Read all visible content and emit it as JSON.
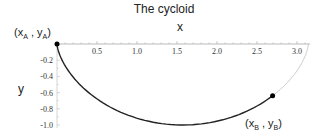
{
  "chart_data": {
    "type": "line",
    "title": "The cycloid",
    "xlabel": "x",
    "ylabel": "y",
    "x_ticks": [
      "0.5",
      "1.0",
      "1.5",
      "2.0",
      "2.5",
      "3.0"
    ],
    "y_ticks": [
      "-0.2",
      "-0.4",
      "-0.6",
      "-0.8",
      "-1.0"
    ],
    "xlim": [
      0,
      3.14159
    ],
    "ylim": [
      -1.0,
      0
    ],
    "grid": false,
    "series": [
      {
        "name": "cycloid path A to B",
        "style": "solid dark",
        "x": [
          0,
          0.04,
          0.16,
          0.36,
          0.6,
          0.93,
          1.28,
          1.57,
          1.86,
          2.21,
          2.31
        ],
        "y": [
          0,
          -0.2,
          -0.36,
          -0.52,
          -0.7,
          -0.85,
          -0.96,
          -1.0,
          -0.96,
          -0.85,
          -0.8
        ]
      },
      {
        "name": "cycloid continuation",
        "style": "light gray",
        "x": [
          2.31,
          2.54,
          2.78,
          2.98,
          3.1,
          3.14
        ],
        "y": [
          -0.8,
          -0.6,
          -0.38,
          -0.17,
          -0.04,
          0
        ]
      }
    ],
    "annotations": [
      {
        "label": "(x_A , y_A)",
        "x": 0,
        "y": 0
      },
      {
        "label": "(x_B , y_B)",
        "x": 2.31,
        "y": -0.8
      }
    ]
  },
  "labels": {
    "title": "The cycloid",
    "x": "x",
    "y": "y",
    "pointA": {
      "open": "(x",
      "sub1": "A",
      "mid": " , y",
      "sub2": "A",
      "close": ")"
    },
    "pointB": {
      "open": "(x",
      "sub1": "B",
      "mid": " , y",
      "sub2": "B",
      "close": ")"
    }
  }
}
